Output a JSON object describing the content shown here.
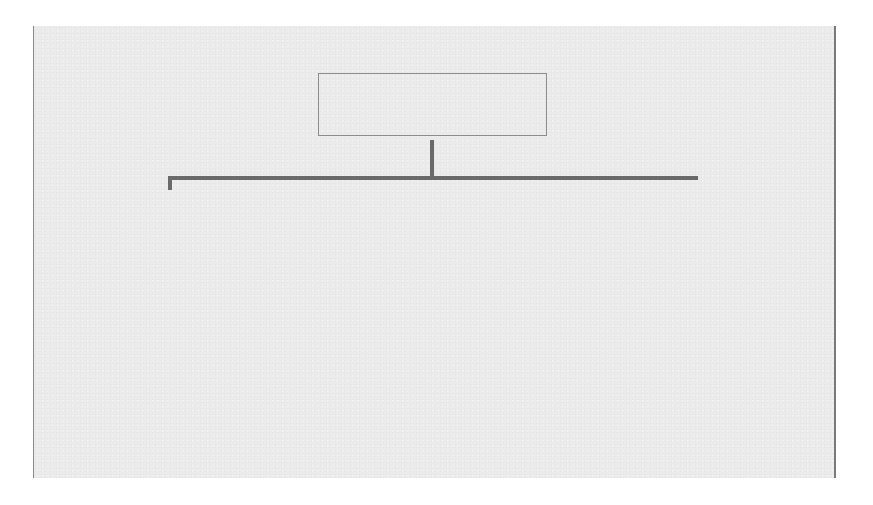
{
  "figure": {
    "root": {
      "label": "Baseline colonoscopy"
    },
    "branches": [
      {
        "risk_label": "Low risk",
        "node_label": "A",
        "interval_label": "No surveillance or in five years*",
        "findings": {
          "title": "Findings at follow-up",
          "items": [
            "No adenomas → cease follow-up",
            "Low-risk adenomas → A",
            "Intermediate-risk adenomas → B",
            "High-risk adenomas → C"
          ]
        }
      },
      {
        "risk_label": "Intermediate risk",
        "node_label": "B",
        "interval_label": "Three years",
        "findings": {
          "title": "Findings at follow-up",
          "items": [
            "One negative exam → B",
            "Two consecutive negative exams → cease follow-up*",
            "Low- or intermediate-risk adenomas → B",
            "High-risk adenomas → C"
          ]
        }
      },
      {
        "risk_label": "High risk",
        "node_label": "C",
        "interval_label": "One year",
        "findings": {
          "title": "Findings at follow-up",
          "items": [
            "Negative, low- or intermediate-risk adenomas → B",
            "High-risk adenomas → C"
          ]
        }
      }
    ],
    "footnote": {
      "title": "*Other considerations",
      "text": "Age, comorbidity, family history, accuracy and completeness of examination"
    }
  },
  "colors": {
    "panel_background": "#ebebeb",
    "connector": "#6a6a6a",
    "box_border": "#8c8c8c",
    "text": "#333333"
  }
}
